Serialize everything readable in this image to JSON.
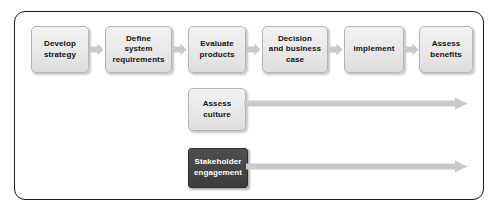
{
  "diagram": {
    "type": "process-flow",
    "title": "",
    "frame": {
      "border_color": "#1a1a1a",
      "background": "#ffffff"
    },
    "colors": {
      "box_light_fill": "#eaeaea",
      "box_light_border": "#b4b4b4",
      "box_dark_fill": "#464646",
      "box_dark_text": "#ffffff",
      "arrow_fill": "#c9c9c9",
      "text": "#111111"
    },
    "process_steps": [
      {
        "id": "develop-strategy",
        "label": "Develop\nstrategy",
        "style": "light"
      },
      {
        "id": "define-system-requirements",
        "label": "Define\nsystem\nrequirements",
        "style": "light"
      },
      {
        "id": "evaluate-products",
        "label": "Evaluate\nproducts",
        "style": "light"
      },
      {
        "id": "decision-and-business-case",
        "label": "Decision\nand business\ncase",
        "style": "light"
      },
      {
        "id": "implement",
        "label": "implement",
        "style": "light"
      },
      {
        "id": "assess-benefits",
        "label": "Assess\nbenefits",
        "style": "light"
      }
    ],
    "parallel_tracks": [
      {
        "id": "assess-culture",
        "label": "Assess\nculture",
        "style": "light"
      },
      {
        "id": "stakeholder-engagement",
        "label": "Stakeholder\nengagement",
        "style": "dark"
      }
    ],
    "connectors": [
      {
        "from": "develop-strategy",
        "to": "define-system-requirements"
      },
      {
        "from": "define-system-requirements",
        "to": "evaluate-products"
      },
      {
        "from": "evaluate-products",
        "to": "decision-and-business-case"
      },
      {
        "from": "decision-and-business-case",
        "to": "implement"
      },
      {
        "from": "implement",
        "to": "assess-benefits"
      }
    ],
    "track_arrows": [
      {
        "from": "assess-culture",
        "direction": "right"
      },
      {
        "from": "stakeholder-engagement",
        "direction": "right"
      }
    ]
  }
}
